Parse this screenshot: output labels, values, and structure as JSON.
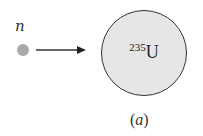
{
  "diagram": {
    "particle_label": "n",
    "nucleus_mass_number": "235",
    "nucleus_symbol": "U",
    "caption_open": "(",
    "caption_letter": "a",
    "caption_close": ")",
    "colors": {
      "neutron": "#a9a9a9",
      "nucleus_fill": "#e6e6e6",
      "stroke": "#333333"
    }
  }
}
